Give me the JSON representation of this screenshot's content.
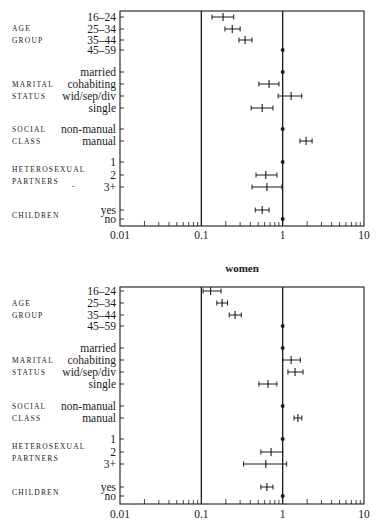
{
  "chart_data": [
    {
      "type": "forest",
      "title": "",
      "xlabel": "",
      "xscale": "log",
      "xlim": [
        0.01,
        10
      ],
      "xticks": [
        "0.01",
        "0.1",
        "1",
        "10"
      ],
      "reference_lines": [
        0.1,
        1
      ],
      "groups": [
        {
          "label": "AGE GROUP",
          "lines": [
            "AGE",
            "GROUP"
          ],
          "rows": [
            {
              "label": "16–24",
              "est": 0.185,
              "lo": 0.135,
              "hi": 0.25
            },
            {
              "label": "25–34",
              "est": 0.24,
              "lo": 0.195,
              "hi": 0.3
            },
            {
              "label": "35–44",
              "est": 0.345,
              "lo": 0.29,
              "hi": 0.42
            },
            {
              "label": "45–59",
              "est": 1,
              "ref": true
            }
          ]
        },
        {
          "label": "MARITAL STATUS",
          "lines": [
            "MARITAL",
            "STATUS"
          ],
          "rows": [
            {
              "label": "married",
              "est": 1,
              "ref": true
            },
            {
              "label": "cohabiting",
              "est": 0.68,
              "lo": 0.51,
              "hi": 0.9
            },
            {
              "label": "wid/sep/div",
              "est": 1.27,
              "lo": 0.88,
              "hi": 1.72
            },
            {
              "label": "single",
              "est": 0.56,
              "lo": 0.41,
              "hi": 0.76
            }
          ]
        },
        {
          "label": "SOCIAL CLASS",
          "lines": [
            "SOCIAL",
            "CLASS"
          ],
          "rows": [
            {
              "label": "non-manual",
              "est": 1,
              "ref": true
            },
            {
              "label": "manual",
              "est": 1.94,
              "lo": 1.63,
              "hi": 2.3
            }
          ]
        },
        {
          "label": "HETEROSEXUAL PARTNERS",
          "lines": [
            "HETEROSEXUAL",
            "PARTNERS"
          ],
          "rows": [
            {
              "label": "1",
              "est": 1,
              "ref": true
            },
            {
              "label": "2",
              "est": 0.62,
              "lo": 0.47,
              "hi": 0.85
            },
            {
              "label": "3+",
              "est": 0.64,
              "lo": 0.42,
              "hi": 0.98
            }
          ]
        },
        {
          "label": "CHILDREN",
          "lines": [
            "CHILDREN"
          ],
          "rows": [
            {
              "label": "yes",
              "est": 0.56,
              "lo": 0.46,
              "hi": 0.68
            },
            {
              "label": "no",
              "est": 1,
              "ref": true
            }
          ]
        }
      ]
    },
    {
      "type": "forest",
      "title": "women",
      "xlabel": "",
      "xscale": "log",
      "xlim": [
        0.01,
        10
      ],
      "xticks": [
        "0.01",
        "0.1",
        "1",
        "10"
      ],
      "reference_lines": [
        0.1,
        1
      ],
      "groups": [
        {
          "label": "AGE GROUP",
          "lines": [
            "AGE",
            "GROUP"
          ],
          "rows": [
            {
              "label": "16–24",
              "est": 0.13,
              "lo": 0.105,
              "hi": 0.175
            },
            {
              "label": "25–34",
              "est": 0.18,
              "lo": 0.155,
              "hi": 0.21
            },
            {
              "label": "35–44",
              "est": 0.26,
              "lo": 0.22,
              "hi": 0.31
            },
            {
              "label": "45–59",
              "est": 1,
              "ref": true
            }
          ]
        },
        {
          "label": "MARITAL STATUS",
          "lines": [
            "MARITAL",
            "STATUS"
          ],
          "rows": [
            {
              "label": "married",
              "est": 1,
              "ref": true
            },
            {
              "label": "cohabiting",
              "est": 1.27,
              "lo": 1.0,
              "hi": 1.65
            },
            {
              "label": "wid/sep/div",
              "est": 1.42,
              "lo": 1.16,
              "hi": 1.78
            },
            {
              "label": "single",
              "est": 0.66,
              "lo": 0.51,
              "hi": 0.85
            }
          ]
        },
        {
          "label": "SOCIAL CLASS",
          "lines": [
            "SOCIAL",
            "CLASS"
          ],
          "rows": [
            {
              "label": "non-manual",
              "est": 1,
              "ref": true
            },
            {
              "label": "manual",
              "est": 1.54,
              "lo": 1.38,
              "hi": 1.72
            }
          ]
        },
        {
          "label": "HETEROSEXUAL PARTNERS",
          "lines": [
            "HETEROSEXUAL",
            "PARTNERS"
          ],
          "rows": [
            {
              "label": "1",
              "est": 1,
              "ref": true
            },
            {
              "label": "2",
              "est": 0.72,
              "lo": 0.54,
              "hi": 1.0
            },
            {
              "label": "3+",
              "est": 0.62,
              "lo": 0.33,
              "hi": 1.12
            }
          ]
        },
        {
          "label": "CHILDREN",
          "lines": [
            "CHILDREN"
          ],
          "rows": [
            {
              "label": "yes",
              "est": 0.64,
              "lo": 0.54,
              "hi": 0.76
            },
            {
              "label": "no",
              "est": 1,
              "ref": true
            }
          ]
        }
      ]
    }
  ],
  "layout_rows": [
    {
      "top": 11,
      "bottom": 226,
      "rowY": [
        [
          17,
          29,
          40,
          50
        ],
        [
          72,
          84,
          96,
          108
        ],
        [
          129,
          141
        ],
        [
          162,
          175,
          187
        ],
        [
          210,
          219
        ]
      ],
      "titleY": null,
      "tickLabelY": 239
    },
    {
      "top": 287,
      "bottom": 504,
      "rowY": [
        [
          291,
          303,
          315,
          326
        ],
        [
          348,
          360,
          372,
          384
        ],
        [
          406,
          418
        ],
        [
          439,
          452,
          464
        ],
        [
          487,
          496
        ]
      ],
      "titleY": 272,
      "tickLabelY": 518
    }
  ],
  "stray_mark": "-"
}
